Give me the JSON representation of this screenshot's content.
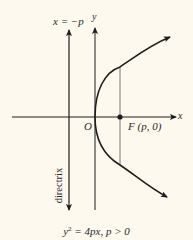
{
  "diagram": {
    "type": "parabola",
    "equation": {
      "lhs_base": "y",
      "lhs_exp": "2",
      "rhs": " = 4px, p > 0"
    },
    "labels": {
      "directrix_eq": "x = −p",
      "y_axis": "y",
      "x_axis": "x",
      "origin": "O",
      "focus": "F (p, 0)",
      "directrix": "directrix"
    },
    "colors": {
      "background": "#fdf9ef",
      "ink": "#1e1e1e",
      "thin_line": "#555555"
    },
    "geometry": {
      "origin_px": [
        95,
        117
      ],
      "focus_px": [
        120,
        117
      ],
      "directrix_x_px": 69,
      "p_px": 25
    }
  }
}
